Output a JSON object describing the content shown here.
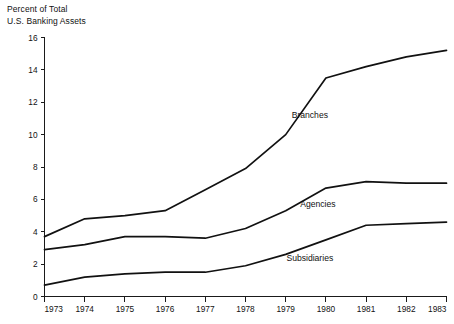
{
  "chart_data": {
    "type": "line",
    "title": "Percent of Total\nU.S. Banking Assets",
    "title_line1": "Percent of Total",
    "title_line2": "U.S. Banking Assets",
    "xlabel": "",
    "ylabel": "Percent of Total U.S. Banking Assets",
    "grid": false,
    "legend_position": "inline-labels",
    "x": [
      1973,
      1974,
      1975,
      1976,
      1977,
      1978,
      1979,
      1980,
      1981,
      1982,
      1983
    ],
    "categories": [
      "1973",
      "1974",
      "1975",
      "1976",
      "1977",
      "1978",
      "1979",
      "1980",
      "1981",
      "1982",
      "1983"
    ],
    "xlim": [
      1973,
      1983
    ],
    "ylim": [
      0,
      16
    ],
    "yticks": [
      0,
      2,
      4,
      6,
      8,
      10,
      12,
      14,
      16
    ],
    "ytick_labels": [
      "0",
      "2",
      "4",
      "6",
      "8",
      "10",
      "12",
      "14",
      "16"
    ],
    "series": [
      {
        "name": "Branches",
        "color": "#111111",
        "values": [
          3.7,
          4.8,
          5.0,
          5.3,
          6.6,
          7.9,
          10.0,
          13.5,
          14.2,
          14.8,
          15.2
        ]
      },
      {
        "name": "Agencies",
        "color": "#111111",
        "values": [
          2.9,
          3.2,
          3.7,
          3.7,
          3.6,
          4.2,
          5.3,
          6.7,
          7.1,
          7.0,
          7.0
        ]
      },
      {
        "name": "Subsidiaries",
        "color": "#111111",
        "values": [
          0.7,
          1.2,
          1.4,
          1.5,
          1.5,
          1.9,
          2.6,
          3.5,
          4.4,
          4.5,
          4.6
        ]
      }
    ],
    "annotations": [
      {
        "text": "Branches",
        "x": 1979.6,
        "y": 11.0
      },
      {
        "text": "Agencies",
        "x": 1979.8,
        "y": 5.5
      },
      {
        "text": "Subsidiaries",
        "x": 1979.6,
        "y": 2.2
      }
    ]
  }
}
